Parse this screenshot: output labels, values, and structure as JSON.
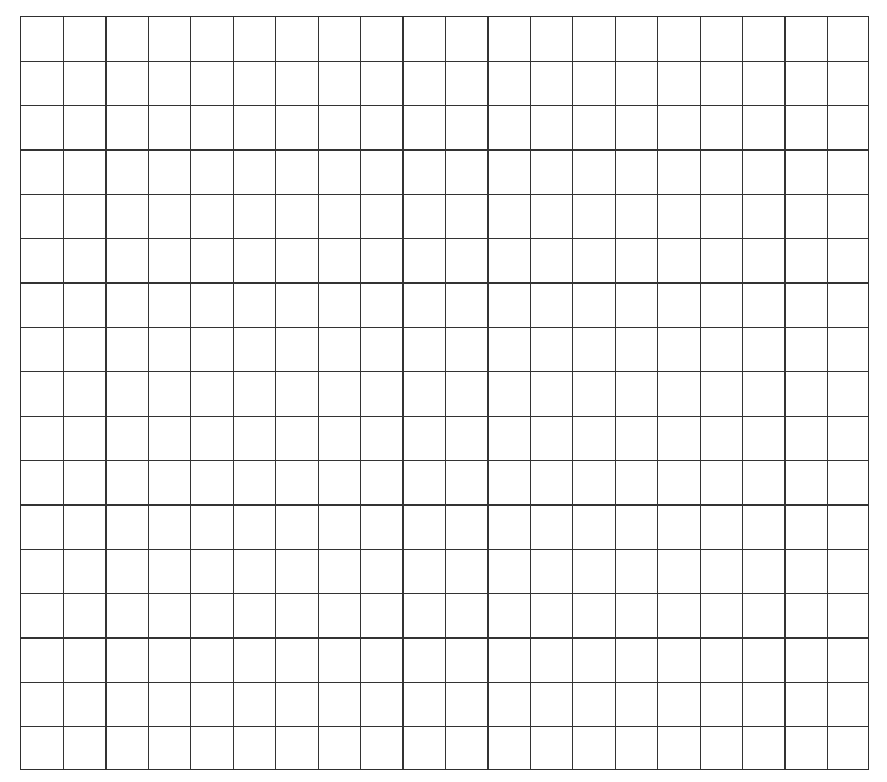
{
  "grid": {
    "columns": 20,
    "rows": 17,
    "line_color": "#333333",
    "background_color": "#ffffff"
  }
}
